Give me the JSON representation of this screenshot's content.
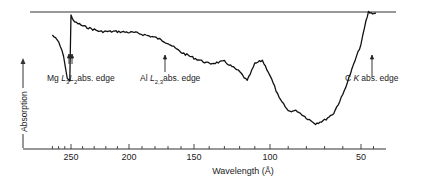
{
  "chart_data": {
    "type": "line",
    "title": "",
    "xlabel": "Wavelength (Å)",
    "ylabel": "Absorption",
    "x_ticks_major": [
      250,
      200,
      150,
      100,
      50
    ],
    "x_axis_reversed": true,
    "grid": false,
    "legend": null,
    "reference_line": "100% absorption (horizontal line at top)",
    "annotations": [
      {
        "text_parts": [
          "Mg ",
          "L",
          "3",
          "L",
          "2",
          "abs. edge"
        ],
        "label": "Mg L3L2 abs. edge",
        "x": 250
      },
      {
        "text_parts": [
          "Al ",
          "L",
          "2,3",
          "abs. edge"
        ],
        "label": "Al L2,3 abs. edge",
        "x": 170
      },
      {
        "text_parts": [
          "C ",
          "K",
          "abs. edge"
        ],
        "label": "C K abs. edge",
        "x": 44
      }
    ],
    "series": [
      {
        "name": "Absorption",
        "x": [
          280,
          270,
          262,
          256,
          252,
          250,
          248,
          240,
          225,
          210,
          195,
          180,
          170,
          160,
          150,
          140,
          130,
          120,
          115,
          110,
          105,
          100,
          95,
          90,
          85,
          80,
          75,
          70,
          65,
          60,
          55,
          50,
          46,
          44,
          42,
          38
        ],
        "values": [
          0.8,
          0.74,
          0.62,
          0.42,
          0.4,
          0.98,
          0.92,
          0.88,
          0.83,
          0.83,
          0.82,
          0.78,
          0.73,
          0.65,
          0.6,
          0.55,
          0.57,
          0.48,
          0.4,
          0.55,
          0.58,
          0.45,
          0.25,
          0.14,
          0.14,
          0.08,
          0.03,
          0.06,
          0.12,
          0.28,
          0.5,
          0.72,
          0.92,
          1.0,
          0.99,
          0.99
        ]
      }
    ]
  }
}
